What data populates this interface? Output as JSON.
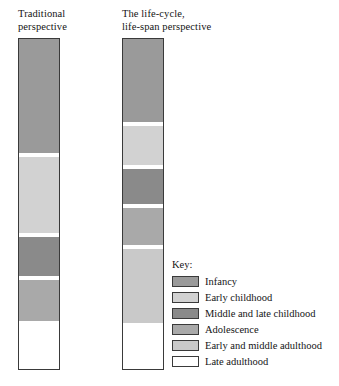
{
  "figure": {
    "columns": [
      {
        "id": "traditional",
        "title": "Traditional\nperspective"
      },
      {
        "id": "lifespan",
        "title": "The life-cycle,\nlife-span perspective"
      }
    ],
    "key": {
      "title": "Key:",
      "entries": [
        {
          "label": "Infancy",
          "color": "#9a9a9a"
        },
        {
          "label": "Early childhood",
          "color": "#d2d2d2"
        },
        {
          "label": "Middle and late childhood",
          "color": "#8a8a8a"
        },
        {
          "label": "Adolescence",
          "color": "#a9a9a9"
        },
        {
          "label": "Early and middle adulthood",
          "color": "#c9c9c9"
        },
        {
          "label": "Late adulthood",
          "color": "#ffffff"
        }
      ]
    }
  },
  "chart_data": {
    "type": "bar",
    "title": "",
    "xlabel": "",
    "ylabel": "",
    "orientation": "vertical-stacked",
    "categories": [
      "Traditional perspective",
      "The life-cycle, life-span perspective"
    ],
    "stack_order": [
      "Infancy",
      "Early childhood",
      "Middle and late childhood",
      "Adolescence",
      "Early and middle adulthood",
      "Late adulthood"
    ],
    "legend": {
      "position": "right",
      "title": "Key:",
      "entries": [
        "Infancy",
        "Early childhood",
        "Middle and late childhood",
        "Adolescence",
        "Early and middle adulthood",
        "Late adulthood"
      ]
    },
    "grid": false,
    "series": [
      {
        "name": "Traditional perspective",
        "segments": [
          {
            "label": "Infancy",
            "color": "#9a9a9a",
            "top_pct": 0.0,
            "height_pct": 34.6
          },
          {
            "label": "Early childhood",
            "color": "#d2d2d2",
            "top_pct": 35.2,
            "height_pct": 23.5
          },
          {
            "label": "Middle and late childhood",
            "color": "#8a8a8a",
            "top_pct": 59.3,
            "height_pct": 12.4
          },
          {
            "label": "Adolescence",
            "color": "#a9a9a9",
            "top_pct": 72.3,
            "height_pct": 13.3
          },
          {
            "label": "Late adulthood",
            "color": "#ffffff",
            "top_pct": 86.1,
            "height_pct": 13.9
          }
        ]
      },
      {
        "name": "The life-cycle, life-span perspective",
        "segments": [
          {
            "label": "Infancy",
            "color": "#9a9a9a",
            "top_pct": 0.0,
            "height_pct": 25.3
          },
          {
            "label": "Early childhood",
            "color": "#d2d2d2",
            "top_pct": 25.9,
            "height_pct": 12.4
          },
          {
            "label": "Middle and late childhood",
            "color": "#8a8a8a",
            "top_pct": 38.9,
            "height_pct": 11.1
          },
          {
            "label": "Adolescence",
            "color": "#a9a9a9",
            "top_pct": 50.6,
            "height_pct": 11.7
          },
          {
            "label": "Early and middle adulthood",
            "color": "#c9c9c9",
            "top_pct": 62.9,
            "height_pct": 23.2
          },
          {
            "label": "Late adulthood",
            "color": "#ffffff",
            "top_pct": 86.7,
            "height_pct": 13.3
          }
        ]
      }
    ]
  }
}
